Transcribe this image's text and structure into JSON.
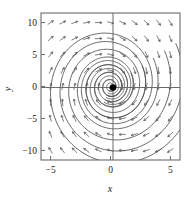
{
  "figure": {
    "kind": "phase-portrait",
    "background": "#ffffff",
    "frame_color": "#6b6b6b",
    "axis_color": "#6b6b6b",
    "trajectory_color": "#4d4d4d",
    "arrow_color": "#555555",
    "fixed_point_color": "#000000"
  },
  "axes": {
    "x_title": "x",
    "y_title": "y",
    "x_ticks": [
      {
        "value": -5,
        "label": "−5"
      },
      {
        "value": 0,
        "label": "0"
      },
      {
        "value": 5,
        "label": "5"
      }
    ],
    "y_ticks": [
      {
        "value": 10,
        "label": "10"
      },
      {
        "value": 5,
        "label": "5"
      },
      {
        "value": 0,
        "label": "0"
      },
      {
        "value": -5,
        "label": "−5"
      },
      {
        "value": -10,
        "label": "−10"
      }
    ]
  },
  "chart_data": {
    "type": "scatter",
    "title": "",
    "xlabel": "x",
    "ylabel": "y",
    "xlim": [
      -5.8,
      5.8
    ],
    "ylim": [
      -11.5,
      11.5
    ],
    "grid": false,
    "legend": "none",
    "xticks": [
      -5,
      0,
      5
    ],
    "yticks": [
      -10,
      -5,
      0,
      5,
      10
    ],
    "fixed_points": [
      {
        "x": 0,
        "y": 0,
        "type": "stable-spiral",
        "marker": "filled-dot"
      }
    ],
    "flow": {
      "rotation": "clockwise",
      "stability": "asymptotically-stable",
      "arrow_rule": "left-half-plane arrows point up, right-half-plane arrows point down"
    },
    "arrow_grid": {
      "x_values": [
        -5.0,
        -4.0,
        -3.0,
        -2.0,
        -1.0,
        0.0,
        1.0,
        2.0,
        3.0,
        4.0,
        5.0
      ],
      "y_values": [
        -10.0,
        -7.5,
        -5.0,
        -2.5,
        0.0,
        2.5,
        5.0,
        7.5,
        10.0
      ]
    },
    "trajectories": [
      {
        "name": "orbit-1",
        "start_radius": 1.0,
        "turns": 2.4
      },
      {
        "name": "orbit-2",
        "start_radius": 2.0,
        "turns": 2.4
      },
      {
        "name": "orbit-3",
        "start_radius": 3.1,
        "turns": 2.4
      },
      {
        "name": "orbit-4",
        "start_radius": 4.2,
        "turns": 2.4
      },
      {
        "name": "orbit-5",
        "start_radius": 5.3,
        "turns": 2.4
      },
      {
        "name": "orbit-6",
        "start_radius": 6.4,
        "turns": 2.4
      },
      {
        "name": "orbit-7",
        "start_radius": 7.6,
        "turns": 2.4
      }
    ]
  }
}
